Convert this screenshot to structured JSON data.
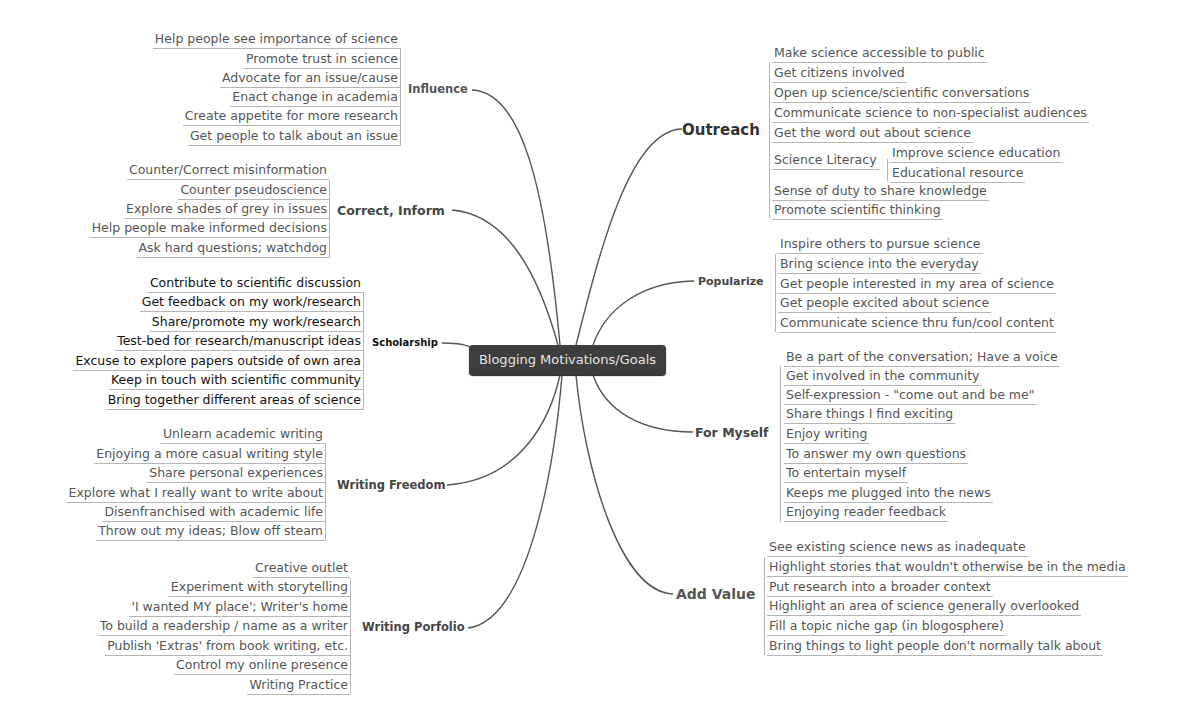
{
  "central_topic": "Blogging Motivations/Goals",
  "colors": {
    "central_bg": "#3d3d3d",
    "central_text": "#e6e6e6",
    "link": "#555555",
    "leaf_text": "#555555",
    "leaf_underline": "#b5b5b5"
  },
  "branches": {
    "influence": {
      "label": "Influence",
      "items": [
        "Help people see importance of science",
        "Promote trust in science",
        "Advocate for an issue/cause",
        "Enact change in academia",
        "Create appetite for more research",
        "Get people to talk about an issue"
      ]
    },
    "correct_inform": {
      "label": "Correct, Inform",
      "items": [
        "Counter/Correct misinformation",
        "Counter pseudoscience",
        "Explore shades of grey in issues",
        "Help people make informed decisions",
        "Ask hard questions; watchdog"
      ]
    },
    "scholarship": {
      "label": "Scholarship",
      "items": [
        "Contribute to scientific discussion",
        "Get feedback on my work/research",
        "Share/promote my work/research",
        "Test-bed for research/manuscript ideas",
        "Excuse to explore papers outside of own area",
        "Keep in touch with scientific community",
        "Bring together different areas of science"
      ]
    },
    "writing_freedom": {
      "label": "Writing Freedom",
      "items": [
        "Unlearn academic writing",
        "Enjoying a more casual writing style",
        "Share personal experiences",
        "Explore what I really want to write about",
        "Disenfranchised with academic life",
        "Throw out my ideas; Blow off steam"
      ]
    },
    "writing_porfolio": {
      "label": "Writing Porfolio",
      "items": [
        "Creative outlet",
        "Experiment with storytelling",
        "'I wanted MY place'; Writer's home",
        "To build a readership / name as a writer",
        "Publish 'Extras' from book writing, etc.",
        "Control my online presence",
        "Writing Practice"
      ]
    },
    "outreach": {
      "label": "Outreach",
      "items": [
        "Make science accessible to public",
        "Get citizens involved",
        "Open up science/scientific conversations",
        "Communicate science to non-specialist audiences",
        "Get the word out about science",
        "Science Literacy",
        "Sense of duty to share knowledge",
        "Promote scientific thinking"
      ],
      "science_literacy_children": [
        "Improve science education",
        "Educational resource"
      ]
    },
    "popularize": {
      "label": "Popularize",
      "items": [
        "Inspire others to pursue science",
        "Bring science into the everyday",
        "Get people interested in my area of science",
        "Get people excited about science",
        "Communicate science thru fun/cool content"
      ]
    },
    "for_myself": {
      "label": "For Myself",
      "items": [
        "Be a part of the conversation; Have a voice",
        "Get involved in the community",
        "Self-expression - \"come out and be me\"",
        "Share things I find exciting",
        "Enjoy writing",
        "To answer my own questions",
        "To entertain myself",
        "Keeps me plugged into the news",
        "Enjoying reader feedback"
      ]
    },
    "add_value": {
      "label": "Add Value",
      "items": [
        "See existing science news as inadequate",
        "Highlight stories that wouldn't otherwise be in the media",
        "Put research into a broader context",
        "Highlight an area of science generally overlooked",
        "Fill a topic niche gap (in blogosphere)",
        "Bring things to light  people don't normally talk about"
      ]
    }
  }
}
